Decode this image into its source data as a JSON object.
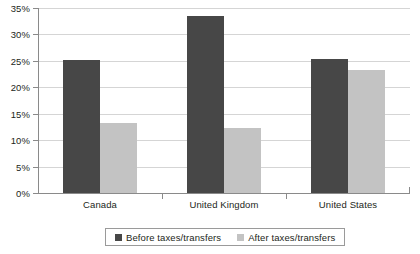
{
  "chart_data": {
    "type": "bar",
    "title": "",
    "subtitle": "",
    "xlabel": "",
    "ylabel": "",
    "categories": [
      "Canada",
      "United Kingdom",
      "United States"
    ],
    "series": [
      {
        "name": "Before taxes/transfers",
        "color": "#474747",
        "values": [
          25.1,
          33.4,
          25.4
        ]
      },
      {
        "name": "After taxes/transfers",
        "color": "#c3c3c3",
        "values": [
          13.3,
          12.3,
          23.3
        ]
      }
    ],
    "ylim": [
      0,
      35
    ],
    "ytick_values": [
      0,
      5,
      10,
      15,
      20,
      25,
      30,
      35
    ],
    "ytick_labels": [
      "0%",
      "5%",
      "10%",
      "15%",
      "20%",
      "25%",
      "30%",
      "35%"
    ],
    "grid": true,
    "grid_axis": "y",
    "legend_position": "bottom"
  },
  "legend": {
    "entries": [
      {
        "label": "Before taxes/transfers",
        "swatch": "before"
      },
      {
        "label": "After taxes/transfers",
        "swatch": "after"
      }
    ]
  },
  "colors": {
    "before": "#474747",
    "after": "#c3c3c3",
    "gridline": "#d5d5d5",
    "axis": "#8a8a8a",
    "text": "#231f20",
    "background": "#ffffff"
  }
}
